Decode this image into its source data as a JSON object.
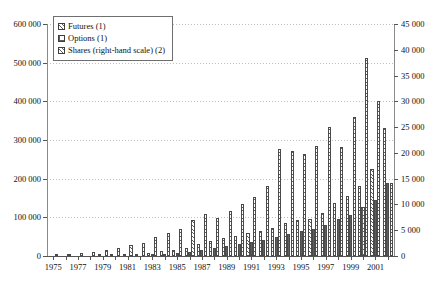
{
  "chart_data": {
    "type": "bar",
    "title": "",
    "subtitle": "",
    "xlabel": "",
    "ylabel": "",
    "ylabel_right": "",
    "grid": true,
    "legend_position": "top-left",
    "categories": [
      "1975",
      "1976",
      "1977",
      "1978",
      "1979",
      "1980",
      "1981",
      "1982",
      "1983",
      "1984",
      "1985",
      "1986",
      "1987",
      "1988",
      "1989",
      "1990",
      "1991",
      "1992",
      "1993",
      "1994",
      "1995",
      "1996",
      "1997",
      "1998",
      "1999",
      "2000",
      "2001",
      "2002"
    ],
    "xtick_labels": [
      "1975",
      "1977",
      "1979",
      "1981",
      "1983",
      "1985",
      "1987",
      "1989",
      "1991",
      "1993",
      "1995",
      "1997",
      "1999",
      "2001"
    ],
    "ylim": [
      0,
      600000
    ],
    "yticks": [
      0,
      100000,
      200000,
      300000,
      400000,
      500000,
      600000
    ],
    "ytick_labels": [
      "0",
      "100 000",
      "200 000",
      "300 000",
      "400 000",
      "500 000",
      "600 000"
    ],
    "ylim_right": [
      0,
      45000
    ],
    "yticks_right": [
      0,
      5000,
      10000,
      15000,
      20000,
      25000,
      30000,
      35000,
      40000,
      45000
    ],
    "ytick_labels_right": [
      "0",
      "5 000",
      "10 000",
      "15 000",
      "20 000",
      "25 000",
      "30 000",
      "35 000",
      "40 000",
      "45 000"
    ],
    "series": [
      {
        "name": "Futures (1)",
        "axis": "left",
        "pattern": "diagonal-hatch",
        "values": [
          200,
          400,
          700,
          1100,
          1800,
          2800,
          4300,
          5900,
          8400,
          12500,
          16000,
          22000,
          30000,
          40000,
          47000,
          53000,
          59000,
          65000,
          72000,
          86000,
          92000,
          97000,
          112000,
          138000,
          155000,
          180000,
          226000,
          330000
        ]
      },
      {
        "name": "Options (1)",
        "axis": "left",
        "pattern": "grid-hatch",
        "values": [
          0,
          0,
          0,
          0,
          0,
          0,
          300,
          800,
          2600,
          5000,
          7500,
          11000,
          16000,
          21000,
          26000,
          31000,
          36000,
          41000,
          48000,
          57000,
          64000,
          70000,
          80000,
          95000,
          107000,
          126000,
          146000,
          190000
        ]
      },
      {
        "name": "Shares (right-hand scale) (2)",
        "axis": "right",
        "pattern": "diagonal-hatch",
        "values": [
          300,
          450,
          600,
          800,
          1100,
          1500,
          2100,
          2600,
          3700,
          4400,
          5200,
          6900,
          8200,
          7400,
          8800,
          10000,
          11400,
          13600,
          20700,
          20400,
          19700,
          21300,
          25000,
          21200,
          27000,
          38500,
          30100,
          14200
        ]
      }
    ]
  },
  "legend": {
    "items": [
      {
        "label": "Futures (1)",
        "swatch": "diagonal-hatch"
      },
      {
        "label": "Options (1)",
        "swatch": "grid-hatch"
      },
      {
        "label": "Shares (right-hand scale) (2)",
        "swatch": "diagonal-hatch"
      }
    ]
  }
}
